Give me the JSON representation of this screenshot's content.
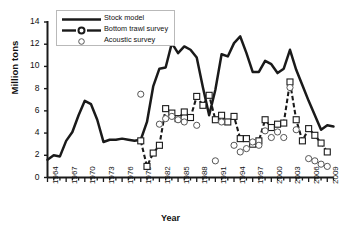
{
  "chart_data": {
    "type": "line",
    "title": "",
    "xlabel": "Year",
    "ylabel": "Million tons",
    "xlim": [
      1964,
      2010
    ],
    "ylim": [
      0,
      14
    ],
    "ytick_values": [
      0,
      2,
      4,
      6,
      8,
      10,
      12,
      14
    ],
    "xtick_values": [
      1964,
      1967,
      1970,
      1973,
      1976,
      1979,
      1982,
      1985,
      1988,
      1991,
      1994,
      1997,
      2000,
      2003,
      2006,
      2009
    ],
    "xtick_minor_step": 1,
    "grid": false,
    "legend_position": "upper-left-inside",
    "series": [
      {
        "name": "Stock model",
        "style": "solid-line",
        "marker": "none",
        "color": "#1a1a1a",
        "x": [
          1964,
          1965,
          1966,
          1967,
          1968,
          1969,
          1970,
          1971,
          1972,
          1973,
          1974,
          1975,
          1976,
          1977,
          1978,
          1979,
          1980,
          1981,
          1982,
          1983,
          1984,
          1985,
          1986,
          1987,
          1988,
          1989,
          1990,
          1991,
          1992,
          1993,
          1994,
          1995,
          1996,
          1997,
          1998,
          1999,
          2000,
          2001,
          2002,
          2003,
          2004,
          2005,
          2006,
          2007,
          2008,
          2009,
          2010
        ],
        "values": [
          1.6,
          2.0,
          1.9,
          3.3,
          4.1,
          5.6,
          6.9,
          6.6,
          5.2,
          3.2,
          3.4,
          3.4,
          3.5,
          3.4,
          3.3,
          3.4,
          5.0,
          8.2,
          9.8,
          9.9,
          12.1,
          11.2,
          11.8,
          11.5,
          10.8,
          8.1,
          5.6,
          7.9,
          11.1,
          10.9,
          12.1,
          12.7,
          11.2,
          9.5,
          9.5,
          10.5,
          10.2,
          9.4,
          9.8,
          11.5,
          9.7,
          8.3,
          6.9,
          5.6,
          4.3,
          4.7,
          4.6
        ]
      },
      {
        "name": "Bottom trawl survey",
        "style": "dashed-line",
        "marker": "open-square",
        "color": "#1a1a1a",
        "x": [
          1979,
          1980,
          1981,
          1982,
          1983,
          1984,
          1985,
          1986,
          1987,
          1988,
          1989,
          1990,
          1991,
          1992,
          1993,
          1994,
          1995,
          1996,
          1997,
          1998,
          1999,
          2000,
          2001,
          2002,
          2003,
          2004,
          2005,
          2006,
          2007,
          2008,
          2009
        ],
        "values": [
          3.3,
          1.0,
          2.2,
          2.9,
          6.2,
          5.8,
          5.3,
          5.9,
          5.4,
          7.3,
          6.5,
          7.4,
          5.2,
          5.6,
          5.0,
          5.5,
          3.5,
          3.5,
          3.0,
          3.3,
          5.2,
          4.5,
          4.8,
          4.9,
          8.6,
          5.2,
          3.3,
          4.4,
          3.8,
          3.1,
          2.3
        ]
      },
      {
        "name": "Acoustic survey",
        "style": "markers-only",
        "marker": "open-circle",
        "color": "#555555",
        "x": [
          1979,
          1982,
          1983,
          1984,
          1985,
          1986,
          1988,
          1991,
          1992,
          1994,
          1995,
          1996,
          1997,
          1998,
          1999,
          2000,
          2001,
          2002,
          2003,
          2004,
          2006,
          2007,
          2008,
          2009
        ],
        "values": [
          7.5,
          4.8,
          5.3,
          5.5,
          5.2,
          5.0,
          4.7,
          1.5,
          5.0,
          2.9,
          2.3,
          2.6,
          3.2,
          2.9,
          4.2,
          3.6,
          4.1,
          3.6,
          8.1,
          4.3,
          1.7,
          1.5,
          1.2,
          1.0
        ]
      }
    ]
  },
  "legend": {
    "items": [
      {
        "label": "Stock model",
        "swatch": "solid-line-swatch"
      },
      {
        "label": "Bottom trawl survey",
        "swatch": "dashed-circle-swatch"
      },
      {
        "label": "Acoustic survey",
        "swatch": "open-circle-swatch"
      }
    ]
  }
}
